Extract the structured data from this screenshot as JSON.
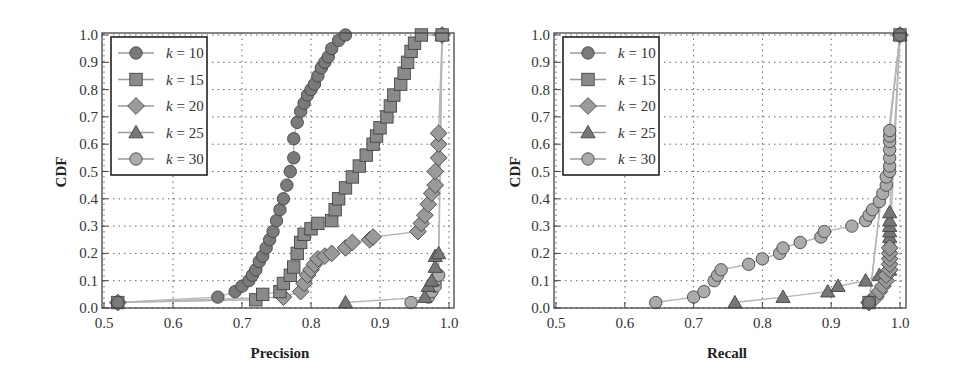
{
  "chart_data": [
    {
      "type": "line",
      "title": "",
      "xlabel": "Precision",
      "ylabel": "CDF",
      "xlim": [
        0.5,
        1.0
      ],
      "ylim": [
        0.0,
        1.0
      ],
      "xticks": [
        "0.5",
        "0.6",
        "0.7",
        "0.8",
        "0.9",
        "1.0"
      ],
      "yticks": [
        "0.0",
        "0.1",
        "0.2",
        "0.3",
        "0.4",
        "0.5",
        "0.6",
        "0.7",
        "0.8",
        "0.9",
        "1.0"
      ],
      "grid": true,
      "legend_position": "upper left",
      "series": [
        {
          "name": "k = 10",
          "marker": "circle",
          "color": "#7a7a7a",
          "x": [
            0.52,
            0.665,
            0.69,
            0.7,
            0.71,
            0.715,
            0.72,
            0.725,
            0.73,
            0.735,
            0.74,
            0.745,
            0.75,
            0.755,
            0.76,
            0.765,
            0.77,
            0.775,
            0.775,
            0.78,
            0.785,
            0.79,
            0.795,
            0.8,
            0.805,
            0.81,
            0.815,
            0.82,
            0.825,
            0.83,
            0.84,
            0.85
          ],
          "y": [
            0.02,
            0.04,
            0.06,
            0.08,
            0.1,
            0.12,
            0.14,
            0.17,
            0.19,
            0.22,
            0.25,
            0.28,
            0.32,
            0.36,
            0.4,
            0.45,
            0.5,
            0.55,
            0.62,
            0.68,
            0.72,
            0.75,
            0.78,
            0.8,
            0.82,
            0.85,
            0.88,
            0.9,
            0.92,
            0.95,
            0.98,
            1.0
          ]
        },
        {
          "name": "k = 15",
          "marker": "square",
          "color": "#8a8a8a",
          "x": [
            0.52,
            0.72,
            0.73,
            0.755,
            0.76,
            0.77,
            0.775,
            0.78,
            0.785,
            0.79,
            0.8,
            0.81,
            0.83,
            0.835,
            0.84,
            0.85,
            0.86,
            0.87,
            0.88,
            0.89,
            0.895,
            0.9,
            0.91,
            0.915,
            0.92,
            0.93,
            0.935,
            0.94,
            0.945,
            0.95,
            0.96,
            0.99
          ],
          "y": [
            0.02,
            0.03,
            0.05,
            0.06,
            0.09,
            0.12,
            0.15,
            0.2,
            0.24,
            0.27,
            0.29,
            0.31,
            0.32,
            0.36,
            0.4,
            0.44,
            0.48,
            0.52,
            0.56,
            0.6,
            0.63,
            0.66,
            0.7,
            0.74,
            0.78,
            0.82,
            0.86,
            0.9,
            0.94,
            0.97,
            1.0,
            1.0
          ]
        },
        {
          "name": "k = 20",
          "marker": "diamond",
          "color": "#9a9a9a",
          "x": [
            0.52,
            0.76,
            0.785,
            0.79,
            0.795,
            0.8,
            0.805,
            0.81,
            0.82,
            0.83,
            0.85,
            0.86,
            0.885,
            0.89,
            0.955,
            0.96,
            0.965,
            0.97,
            0.975,
            0.98,
            0.98,
            0.985,
            0.985,
            0.985,
            0.99
          ],
          "y": [
            0.02,
            0.04,
            0.06,
            0.09,
            0.12,
            0.14,
            0.16,
            0.18,
            0.19,
            0.2,
            0.22,
            0.24,
            0.25,
            0.26,
            0.28,
            0.31,
            0.34,
            0.38,
            0.42,
            0.45,
            0.5,
            0.55,
            0.6,
            0.64,
            1.0
          ]
        },
        {
          "name": "k = 25",
          "marker": "triangle",
          "color": "#777777",
          "x": [
            0.85,
            0.965,
            0.97,
            0.975,
            0.98,
            0.98,
            0.985,
            0.99
          ],
          "y": [
            0.02,
            0.04,
            0.08,
            0.1,
            0.15,
            0.19,
            0.2,
            1.0
          ]
        },
        {
          "name": "k = 30",
          "marker": "circle",
          "color": "#ababab",
          "x": [
            0.945,
            0.97,
            0.975,
            0.98,
            0.98,
            0.985,
            0.99
          ],
          "y": [
            0.02,
            0.04,
            0.06,
            0.08,
            0.1,
            0.12,
            1.0
          ]
        }
      ]
    },
    {
      "type": "line",
      "title": "",
      "xlabel": "Recall",
      "ylabel": "CDF",
      "xlim": [
        0.5,
        1.0
      ],
      "ylim": [
        0.0,
        1.0
      ],
      "xticks": [
        "0.5",
        "0.6",
        "0.7",
        "0.8",
        "0.9",
        "1.0"
      ],
      "yticks": [
        "0.0",
        "0.1",
        "0.2",
        "0.3",
        "0.4",
        "0.5",
        "0.6",
        "0.7",
        "0.8",
        "0.9",
        "1.0"
      ],
      "grid": true,
      "legend_position": "upper left",
      "series": [
        {
          "name": "k = 10",
          "marker": "circle",
          "color": "#7a7a7a",
          "x": [
            0.955,
            1.0
          ],
          "y": [
            0.02,
            1.0
          ]
        },
        {
          "name": "k = 15",
          "marker": "square",
          "color": "#8a8a8a",
          "x": [
            0.955,
            1.0
          ],
          "y": [
            0.02,
            1.0
          ]
        },
        {
          "name": "k = 20",
          "marker": "diamond",
          "color": "#9a9a9a",
          "x": [
            0.955,
            0.965,
            0.97,
            0.975,
            0.98,
            0.98,
            0.985,
            0.985,
            0.985,
            0.985,
            0.985,
            1.0
          ],
          "y": [
            0.02,
            0.04,
            0.06,
            0.08,
            0.1,
            0.12,
            0.14,
            0.16,
            0.18,
            0.2,
            0.22,
            1.0
          ]
        },
        {
          "name": "k = 25",
          "marker": "triangle",
          "color": "#777777",
          "x": [
            0.76,
            0.83,
            0.895,
            0.91,
            0.95,
            0.97,
            0.985,
            0.985,
            0.985,
            0.985,
            0.985,
            0.985,
            0.985,
            0.985,
            0.985,
            0.985,
            0.985,
            1.0
          ],
          "y": [
            0.02,
            0.04,
            0.06,
            0.08,
            0.1,
            0.12,
            0.14,
            0.16,
            0.18,
            0.2,
            0.22,
            0.24,
            0.26,
            0.28,
            0.3,
            0.32,
            0.35,
            1.0
          ]
        },
        {
          "name": "k = 30",
          "marker": "circle",
          "color": "#ababab",
          "x": [
            0.645,
            0.7,
            0.715,
            0.73,
            0.735,
            0.74,
            0.78,
            0.8,
            0.825,
            0.83,
            0.855,
            0.885,
            0.89,
            0.93,
            0.95,
            0.955,
            0.96,
            0.97,
            0.975,
            0.98,
            0.98,
            0.985,
            0.985,
            0.985,
            0.985,
            0.985,
            0.985,
            0.985,
            1.0
          ],
          "y": [
            0.02,
            0.04,
            0.06,
            0.1,
            0.12,
            0.14,
            0.16,
            0.18,
            0.2,
            0.22,
            0.24,
            0.26,
            0.28,
            0.3,
            0.32,
            0.34,
            0.36,
            0.39,
            0.42,
            0.45,
            0.48,
            0.5,
            0.52,
            0.55,
            0.58,
            0.61,
            0.63,
            0.65,
            1.0
          ]
        }
      ]
    }
  ],
  "plots": [
    {
      "xlabel": "Precision",
      "ylabel": "CDF"
    },
    {
      "xlabel": "Recall",
      "ylabel": "CDF"
    }
  ]
}
